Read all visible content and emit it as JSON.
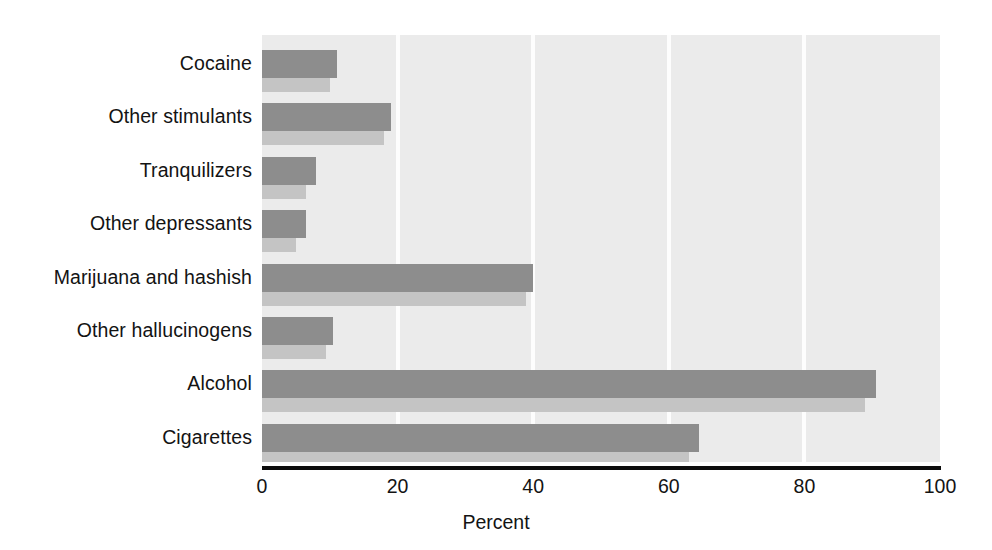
{
  "chart_data": {
    "type": "bar",
    "orientation": "horizontal",
    "title": "",
    "subtitle": "",
    "xlabel": "Percent",
    "ylabel": "",
    "xlim": [
      0,
      100
    ],
    "xticks": [
      0,
      20,
      40,
      60,
      80,
      100
    ],
    "xtick_labels": [
      "0",
      "20",
      "40",
      "60",
      "80",
      "100"
    ],
    "grid": "vertical",
    "legend": "none",
    "categories": [
      "Cocaine",
      "Other stimulants",
      "Tranquilizers",
      "Other depressants",
      "Marijuana and hashish",
      "Other hallucinogens",
      "Alcohol",
      "Cigarettes"
    ],
    "series": [
      {
        "name": "series-1",
        "color": "#8d8d8d",
        "values": [
          11,
          19,
          8,
          6.5,
          40,
          10.5,
          90.5,
          64.5
        ]
      },
      {
        "name": "series-2",
        "color": "#c4c4c4",
        "values": [
          10,
          18,
          6.5,
          5,
          39,
          9.5,
          89,
          63
        ]
      }
    ],
    "plot_background": "#ebebeb",
    "gridline_color": "#fdfdfd",
    "axis_color": "#0d0d0d"
  }
}
